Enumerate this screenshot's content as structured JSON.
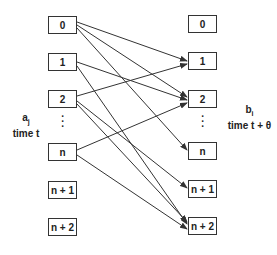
{
  "left": {
    "label_var": "a",
    "label_sub": "j",
    "label_time": "time t",
    "boxes": [
      "0",
      "1",
      "2",
      "n",
      "n + 1",
      "n + 2"
    ],
    "ellipsis": "⋮"
  },
  "right": {
    "label_var": "b",
    "label_sub": "i",
    "label_time": "time t + θ",
    "boxes": [
      "0",
      "1",
      "2",
      "n",
      "n + 1",
      "n + 2"
    ],
    "ellipsis": "⋮"
  },
  "edges": [
    {
      "from": "0",
      "to": "1"
    },
    {
      "from": "0",
      "to": "2"
    },
    {
      "from": "0",
      "to": "n"
    },
    {
      "from": "1",
      "to": "2"
    },
    {
      "from": "1",
      "to": "n + 2"
    },
    {
      "from": "2",
      "to": "1"
    },
    {
      "from": "2",
      "to": "n + 1"
    },
    {
      "from": "2",
      "to": "n + 2"
    },
    {
      "from": "n",
      "to": "2"
    },
    {
      "from": "n",
      "to": "n + 2"
    }
  ],
  "colors": {
    "line": "#333333",
    "box_border": "#333333"
  }
}
